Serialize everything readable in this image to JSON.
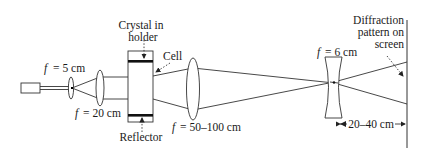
{
  "diagram": {
    "type": "optical-setup",
    "components": {
      "laser": {
        "label": ""
      },
      "lens1": {
        "f_symbol": "f",
        "f_value": "= 5 cm"
      },
      "lens2": {
        "f_symbol": "f",
        "f_value": "= 20 cm"
      },
      "crystal_label_line1": "Crystal in",
      "crystal_label_line2": "holder",
      "cell_label": "Cell",
      "reflector_label": "Reflector",
      "lens3": {
        "f_symbol": "f",
        "f_value": "= 50–100 cm"
      },
      "lens4": {
        "f_symbol": "f",
        "f_value": "= 6 cm"
      },
      "screen_label_line1": "Diffraction",
      "screen_label_line2": "pattern on",
      "screen_label_line3": "screen",
      "distance_label": "20–40 cm"
    },
    "colors": {
      "line": "#333333",
      "text": "#1a1a1a",
      "bar": "#111111",
      "background": "#ffffff"
    }
  }
}
